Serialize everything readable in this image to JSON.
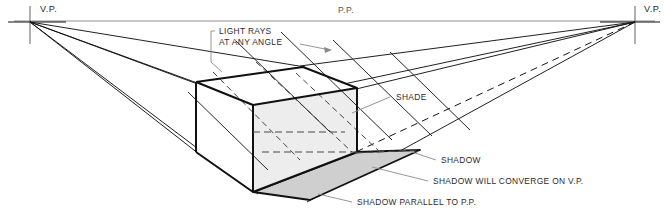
{
  "diagram": {
    "canvas": {
      "width": 667,
      "height": 215
    },
    "colors": {
      "ink": "#111111",
      "horizon": "#8a8a8a",
      "leader": "#7d7d7d",
      "shade_face": "#ededed",
      "top_face": "#ffffff",
      "front_face": "#ffffff",
      "shadow_fill": "#cfcfcf",
      "text": "#2a2a2a",
      "background": "#ffffff"
    },
    "labels": {
      "vp_left": "V.P.",
      "vp_right": "V.P.",
      "picture_plane": "P.P.",
      "light_rays_line1": "LIGHT RAYS",
      "light_rays_line2": "AT ANY ANGLE",
      "shade": "SHADE",
      "shadow": "SHADOW",
      "shadow_converge": "SHADOW WILL CONVERGE ON V.P.",
      "shadow_parallel": "SHADOW PARALLEL TO P.P."
    },
    "points": {
      "vp_left": {
        "x": 30,
        "y": 22
      },
      "vp_right": {
        "x": 635,
        "y": 22
      },
      "horizon_y": 21,
      "box_top_back": {
        "x": 303,
        "y": 67
      },
      "box_top_left": {
        "x": 196,
        "y": 82
      },
      "box_top_front": {
        "x": 253,
        "y": 105
      },
      "box_top_right": {
        "x": 357,
        "y": 88
      },
      "box_bottom_left": {
        "x": 196,
        "y": 152
      },
      "box_bottom_front": {
        "x": 253,
        "y": 192
      },
      "box_bottom_right": {
        "x": 357,
        "y": 152
      },
      "shadow_tip": {
        "x": 420,
        "y": 150
      },
      "shadow_bottom": {
        "x": 310,
        "y": 200
      }
    },
    "elements": [
      {
        "name": "horizon-line",
        "kind": "picture-plane"
      },
      {
        "name": "vanishing-point-left-marker",
        "kind": "cross"
      },
      {
        "name": "vanishing-point-right-marker",
        "kind": "cross"
      },
      {
        "name": "box",
        "kind": "cube"
      },
      {
        "name": "shadow",
        "kind": "polygon"
      },
      {
        "name": "light-rays",
        "kind": "parallel-lines"
      },
      {
        "name": "convergence-lines-left",
        "kind": "rays",
        "count": 4
      },
      {
        "name": "convergence-lines-right",
        "kind": "rays",
        "count": 4
      }
    ]
  }
}
